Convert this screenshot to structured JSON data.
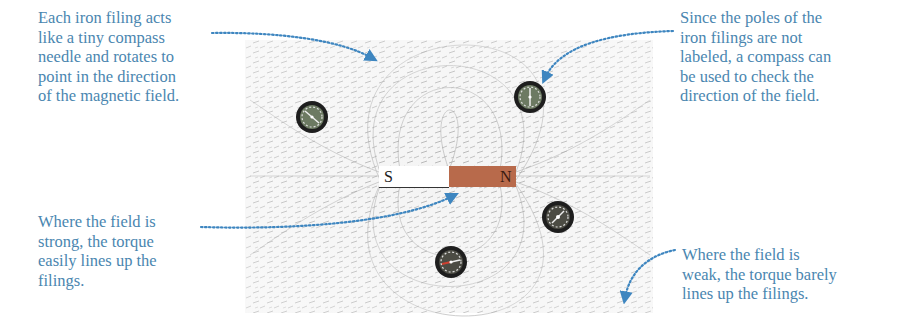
{
  "figure": {
    "magnet": {
      "south_label": "S",
      "north_label": "N",
      "south_color": "#ffffff",
      "north_color": "#b86a4b"
    },
    "compasses": [
      {
        "name": "compass-upper-left",
        "cx": 312,
        "cy": 117
      },
      {
        "name": "compass-upper-right",
        "cx": 530,
        "cy": 97
      },
      {
        "name": "compass-right",
        "cx": 558,
        "cy": 217
      },
      {
        "name": "compass-bottom",
        "cx": 451,
        "cy": 262
      }
    ],
    "field_background_color": "#f2f2f2",
    "filing_color": "#8a8a8a",
    "annotation_color": "#4a86b0"
  },
  "annotations": {
    "top_left": "Each iron filing acts\nlike a tiny compass\nneedle and rotates to\npoint in the direction\nof the magnetic field.",
    "top_right": "Since the poles of the\niron filings are not\nlabeled, a compass can\nbe used to check the\ndirection of the field.",
    "bottom_left": "Where the field is\nstrong, the torque\neasily lines up the\nfilings.",
    "bottom_right": "Where the field is\nweak, the torque barely\nlines up the filings."
  }
}
